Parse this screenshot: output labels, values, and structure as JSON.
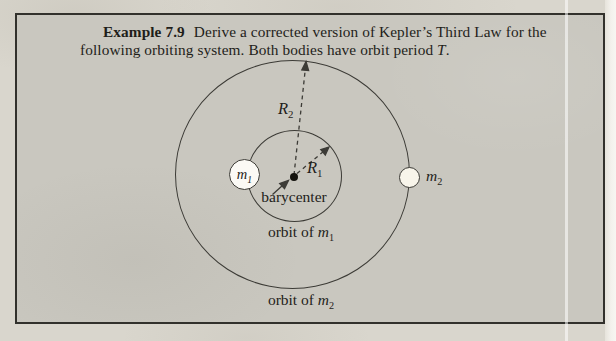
{
  "example": {
    "label": "Example 7.9",
    "title_line1": "Derive a corrected version of Kepler’s Third Law for the",
    "title_line2_prefix": "following orbiting system. Both bodies have orbit period ",
    "period_symbol": "T",
    "period_suffix": "."
  },
  "diagram": {
    "r2_label": {
      "base": "R",
      "sub": "2"
    },
    "r1_label": {
      "base": "R",
      "sub": "1"
    },
    "m1_label": {
      "base": "m",
      "sub": "1"
    },
    "m2_label": {
      "base": "m",
      "sub": "2"
    },
    "barycenter_label": "barycenter",
    "orbit_m1": {
      "prefix": "orbit of ",
      "symbol": "m",
      "sub": "1"
    },
    "orbit_m2": {
      "prefix": "orbit of ",
      "symbol": "m",
      "sub": "2"
    }
  },
  "colors": {
    "page_background": "#d9d6cd",
    "box_background": "#c9c7bf",
    "box_border": "#32312c",
    "line_color": "#3c3b36",
    "text_color": "#1f1e1a",
    "mass_fill": "#fbfaf5",
    "right_strip": "#f3f1ec"
  }
}
